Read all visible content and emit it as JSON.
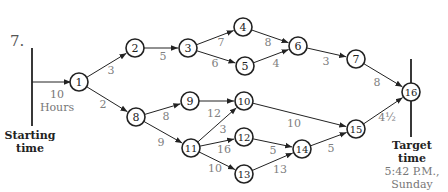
{
  "problem_number": "7.",
  "start": {
    "label_line1": "Starting",
    "label_line2": "time",
    "duration_value": "10",
    "duration_unit": "Hours"
  },
  "target": {
    "label_line1": "Target",
    "label_line2": "time",
    "time_line1": "5:42 P.M.,",
    "time_line2": "Sunday"
  },
  "colors": {
    "line": "#222222",
    "edge_label": "#808080",
    "node_fill": "#ffffff"
  },
  "nodes": [
    {
      "id": "1",
      "x": 79,
      "y": 82
    },
    {
      "id": "2",
      "x": 135,
      "y": 48
    },
    {
      "id": "3",
      "x": 188,
      "y": 48
    },
    {
      "id": "4",
      "x": 243,
      "y": 27
    },
    {
      "id": "5",
      "x": 245,
      "y": 66
    },
    {
      "id": "6",
      "x": 298,
      "y": 46
    },
    {
      "id": "7",
      "x": 356,
      "y": 59
    },
    {
      "id": "8",
      "x": 136,
      "y": 117
    },
    {
      "id": "9",
      "x": 190,
      "y": 101
    },
    {
      "id": "10",
      "x": 244,
      "y": 101
    },
    {
      "id": "11",
      "x": 191,
      "y": 148
    },
    {
      "id": "12",
      "x": 244,
      "y": 137
    },
    {
      "id": "13",
      "x": 244,
      "y": 174
    },
    {
      "id": "14",
      "x": 302,
      "y": 149
    },
    {
      "id": "15",
      "x": 356,
      "y": 129
    },
    {
      "id": "16",
      "x": 411,
      "y": 92
    }
  ],
  "edges": [
    {
      "from": "1",
      "to": "2",
      "weight": "3",
      "lx": 111,
      "ly": 74
    },
    {
      "from": "1",
      "to": "8",
      "weight": "2",
      "lx": 103,
      "ly": 108
    },
    {
      "from": "2",
      "to": "3",
      "weight": "5",
      "lx": 163,
      "ly": 60
    },
    {
      "from": "3",
      "to": "4",
      "weight": "7",
      "lx": 221,
      "ly": 46
    },
    {
      "from": "3",
      "to": "5",
      "weight": "6",
      "lx": 215,
      "ly": 67
    },
    {
      "from": "4",
      "to": "6",
      "weight": "8",
      "lx": 268,
      "ly": 46
    },
    {
      "from": "5",
      "to": "6",
      "weight": "4",
      "lx": 276,
      "ly": 67
    },
    {
      "from": "6",
      "to": "7",
      "weight": "3",
      "lx": 326,
      "ly": 65
    },
    {
      "from": "7",
      "to": "16",
      "weight": "8",
      "lx": 377,
      "ly": 86
    },
    {
      "from": "8",
      "to": "9",
      "weight": "8",
      "lx": 166,
      "ly": 120
    },
    {
      "from": "8",
      "to": "11",
      "weight": "9",
      "lx": 161,
      "ly": 146
    },
    {
      "from": "9",
      "to": "10",
      "weight": "12",
      "lx": 214,
      "ly": 117
    },
    {
      "from": "11",
      "to": "10",
      "weight": "3",
      "lx": 223,
      "ly": 133
    },
    {
      "from": "11",
      "to": "12",
      "weight": "16",
      "lx": 224,
      "ly": 153
    },
    {
      "from": "11",
      "to": "13",
      "weight": "10",
      "lx": 215,
      "ly": 172
    },
    {
      "from": "10",
      "to": "15",
      "weight": "10",
      "lx": 294,
      "ly": 127
    },
    {
      "from": "12",
      "to": "14",
      "weight": "5",
      "lx": 273,
      "ly": 154
    },
    {
      "from": "13",
      "to": "14",
      "weight": "13",
      "lx": 280,
      "ly": 173
    },
    {
      "from": "14",
      "to": "15",
      "weight": "5",
      "lx": 331,
      "ly": 152
    },
    {
      "from": "15",
      "to": "16",
      "weight": "4½",
      "lx": 387,
      "ly": 121
    }
  ]
}
